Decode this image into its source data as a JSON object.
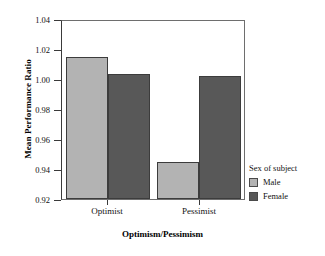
{
  "chart_data": {
    "type": "bar",
    "title": "",
    "xlabel": "Optimism/Pessimism",
    "ylabel": "Mean Performance Ratio",
    "categories": [
      "Optimist",
      "Pessimist"
    ],
    "series": [
      {
        "name": "Male",
        "values": [
          1.016,
          0.945
        ],
        "color": "#b3b3b3"
      },
      {
        "name": "Female",
        "values": [
          1.004,
          1.003
        ],
        "color": "#585858"
      }
    ],
    "ylim": [
      0.92,
      1.04
    ],
    "yticks": [
      1.04,
      1.02,
      1.0,
      0.98,
      0.96,
      0.94,
      0.92
    ],
    "ytick_labels": [
      "1.04",
      "1.02",
      "1.00",
      "0.98",
      "0.96",
      "0.94",
      "0.92"
    ],
    "grid": false,
    "legend": {
      "title": "Sex of subject",
      "position": "right",
      "entries": [
        {
          "label": "Male",
          "color": "#b3b3b3"
        },
        {
          "label": "Female",
          "color": "#585858"
        }
      ]
    }
  },
  "axes": {
    "y_title": "Mean Performance Ratio",
    "x_title": "Optimism/Pessimism",
    "y_tick_0": "1.04",
    "y_tick_1": "1.02",
    "y_tick_2": "1.00",
    "y_tick_3": "0.98",
    "y_tick_4": "0.96",
    "y_tick_5": "0.94",
    "y_tick_6": "0.92",
    "x_tick_0": "Optimist",
    "x_tick_1": "Pessimist"
  },
  "legend": {
    "title": "Sex of subject",
    "item_0": "Male",
    "item_1": "Female"
  }
}
